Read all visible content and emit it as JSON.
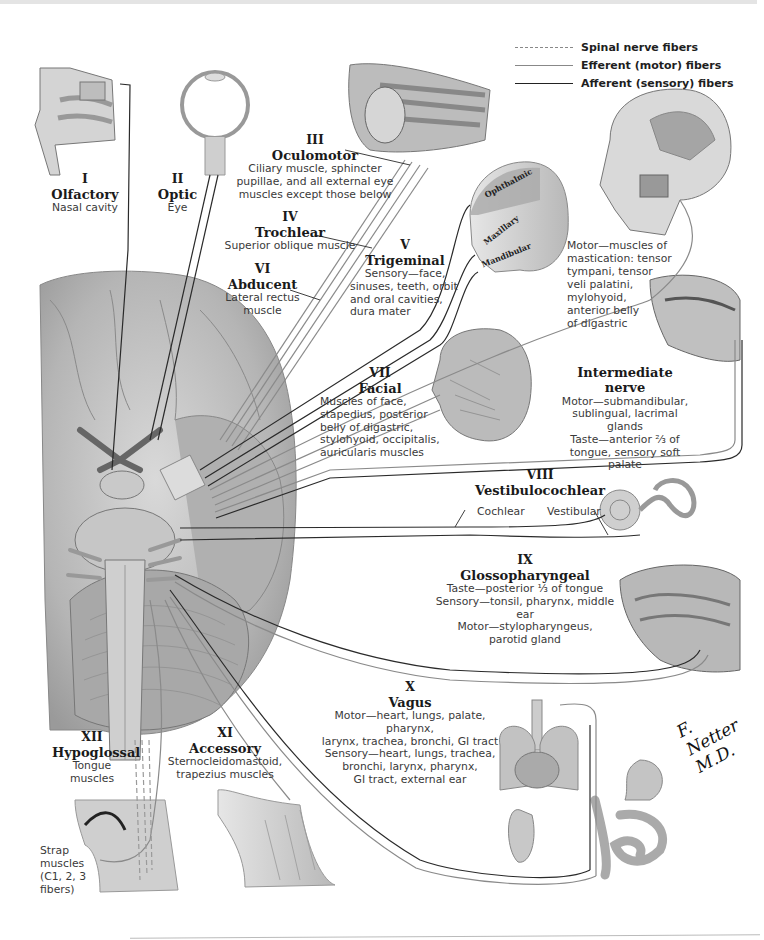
{
  "figure": {
    "signature": "F. Netter M.D."
  },
  "legend": {
    "items": [
      {
        "label": "Spinal nerve fibers",
        "style": "dashed"
      },
      {
        "label": "Efferent (motor) fibers",
        "style": "efferent"
      },
      {
        "label": "Afferent (sensory) fibers",
        "style": "afferent"
      }
    ]
  },
  "colors": {
    "afferent": "#2a2a2a",
    "efferent": "#8a8a8a",
    "spinal": "#9a9a9a",
    "brain_fill": "#bdbdbd",
    "text": "#1a1a1a"
  },
  "nerves": {
    "I": {
      "num": "I",
      "name": "Olfactory",
      "desc": [
        "Nasal cavity"
      ]
    },
    "II": {
      "num": "II",
      "name": "Optic",
      "desc": [
        "Eye"
      ]
    },
    "III": {
      "num": "III",
      "name": "Oculomotor",
      "desc": [
        "Ciliary muscle, sphincter",
        "pupillae, and all external eye",
        "muscles except those below"
      ]
    },
    "IV": {
      "num": "IV",
      "name": "Trochlear",
      "desc": [
        "Superior oblique muscle"
      ]
    },
    "V": {
      "num": "V",
      "name": "Trigeminal",
      "desc": [
        "Sensory—face,",
        "sinuses, teeth, orbit",
        "and oral cavities,",
        "dura mater"
      ],
      "motor": [
        "Motor—muscles of",
        "mastication: tensor",
        "tympani, tensor",
        "veli palatini,",
        "mylohyoid,",
        "anterior belly",
        "of digastric"
      ],
      "divisions": [
        "Ophthalmic",
        "Maxillary",
        "Mandibular"
      ]
    },
    "VI": {
      "num": "VI",
      "name": "Abducent",
      "desc": [
        "Lateral rectus",
        "muscle"
      ]
    },
    "VII": {
      "num": "VII",
      "name": "Facial",
      "desc": [
        "Muscles of face,",
        "stapedius, posterior",
        "belly of digastric,",
        "stylohyoid, occipitalis,",
        "auricularis muscles"
      ]
    },
    "intermediate": {
      "name": "Intermediate nerve",
      "desc": [
        "Motor—submandibular,",
        "sublingual, lacrimal glands",
        "Taste—anterior ²⁄₃ of",
        "tongue, sensory soft palate"
      ]
    },
    "VIII": {
      "num": "VIII",
      "name": "Vestibulocochlear",
      "branches": [
        "Cochlear",
        "Vestibular"
      ]
    },
    "IX": {
      "num": "IX",
      "name": "Glossopharyngeal",
      "desc": [
        "Taste—posterior ¹⁄₃ of tongue",
        "Sensory—tonsil, pharynx, middle ear",
        "Motor—stylopharyngeus,",
        "parotid gland"
      ]
    },
    "X": {
      "num": "X",
      "name": "Vagus",
      "desc": [
        "Motor—heart, lungs, palate, pharynx,",
        "larynx, trachea, bronchi, GI tract",
        "Sensory—heart, lungs, trachea,",
        "bronchi, larynx, pharynx,",
        "GI tract, external ear"
      ]
    },
    "XI": {
      "num": "XI",
      "name": "Accessory",
      "desc": [
        "Sternocleidomastoid,",
        "trapezius muscles"
      ]
    },
    "XII": {
      "num": "XII",
      "name": "Hypoglossal",
      "desc": [
        "Tongue",
        "muscles"
      ],
      "strap": [
        "Strap",
        "muscles",
        "(C1, 2, 3",
        "fibers)"
      ]
    }
  }
}
